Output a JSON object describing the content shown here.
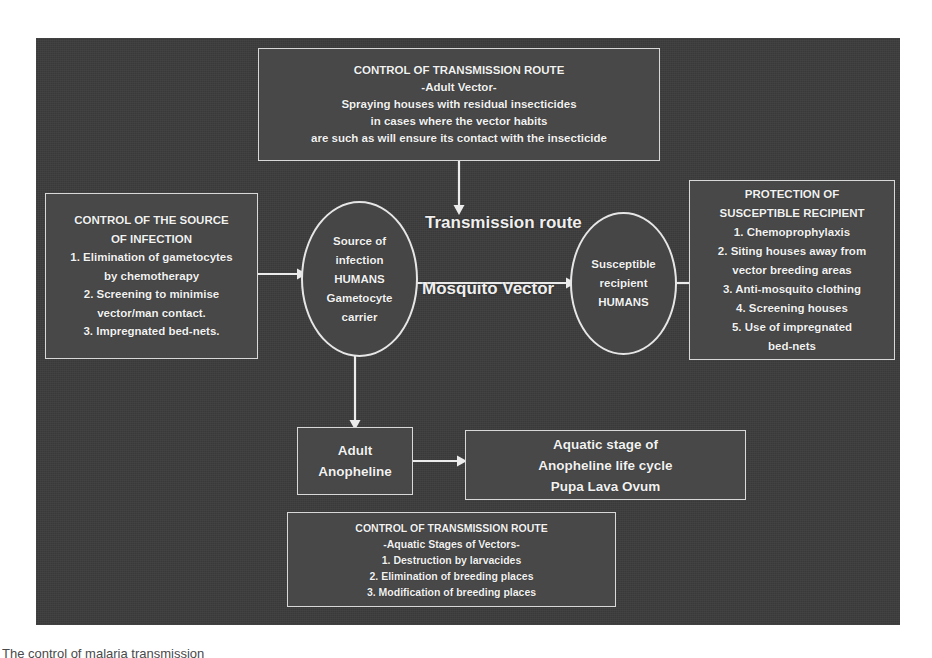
{
  "diagram": {
    "panel_color": "#3c3c3c",
    "box_color": "#484848",
    "stroke_color": "#e6e6e6",
    "text_color": "#f2f2f2",
    "boxes": {
      "top": {
        "name": "control-of-transmission-route-adult-vector",
        "lines": [
          "CONTROL OF TRANSMISSION ROUTE",
          "-Adult Vector-",
          "Spraying houses with residual insecticides",
          "in cases where the vector habits",
          "are such as will ensure its contact with the insecticide"
        ]
      },
      "left": {
        "name": "control-of-the-source-of-infection",
        "lines": [
          "CONTROL OF THE SOURCE",
          "OF INFECTION",
          "1. Elimination of gametocytes",
          "by chemotherapy",
          "2. Screening to minimise",
          "vector/man contact.",
          "3. Impregnated bed-nets."
        ]
      },
      "right": {
        "name": "protection-of-susceptible-recipient",
        "lines": [
          "PROTECTION OF",
          "SUSCEPTIBLE RECIPIENT",
          "1. Chemoprophylaxis",
          "2. Siting houses away from",
          "vector breeding areas",
          "3. Anti-mosquito clothing",
          "4. Screening houses",
          "5. Use of impregnated",
          "bed-nets"
        ]
      },
      "adult_anopheline": {
        "name": "adult-anopheline",
        "lines": [
          "Adult",
          "Anopheline"
        ]
      },
      "aquatic_stage": {
        "name": "aquatic-stage-of-anopheline-life-cycle",
        "lines": [
          "Aquatic stage of",
          "Anopheline life cycle",
          "Pupa    Lava    Ovum"
        ]
      },
      "bottom": {
        "name": "control-of-transmission-route-aquatic-stages",
        "lines": [
          "CONTROL OF TRANSMISSION ROUTE",
          "-Aquatic Stages of Vectors-",
          "1. Destruction by larvacides",
          "2. Elimination of breeding places",
          "3. Modification of breeding places"
        ]
      }
    },
    "ellipses": {
      "source": {
        "name": "source-of-infection-humans",
        "lines": [
          "Source of",
          "infection",
          "HUMANS",
          "Gametocyte",
          "carrier"
        ]
      },
      "recipient": {
        "name": "susceptible-recipient-humans",
        "lines": [
          "Susceptible",
          "recipient",
          "HUMANS"
        ]
      }
    },
    "labels": {
      "transmission_route": "Transmission route",
      "mosquito_vector": "Mosquito Vector"
    },
    "arrows": [
      {
        "name": "arrow-left-box-to-source",
        "from": "control-of-the-source-of-infection",
        "to": "source-of-infection-humans",
        "direction": "right"
      },
      {
        "name": "arrow-top-box-to-transmission",
        "from": "control-of-transmission-route-adult-vector",
        "to": "transmission-route-label",
        "direction": "down"
      },
      {
        "name": "arrow-source-to-recipient",
        "from": "source-of-infection-humans",
        "to": "susceptible-recipient-humans",
        "direction": "right"
      },
      {
        "name": "arrow-right-box-to-recipient",
        "from": "protection-of-susceptible-recipient",
        "to": "susceptible-recipient-humans",
        "direction": "left"
      },
      {
        "name": "arrow-source-to-adult-anopheline",
        "from": "source-of-infection-humans",
        "to": "adult-anopheline",
        "direction": "down"
      },
      {
        "name": "arrow-adult-to-aquatic-stage",
        "from": "adult-anopheline",
        "to": "aquatic-stage-of-anopheline-life-cycle",
        "direction": "right"
      }
    ]
  },
  "caption": "The control of malaria transmission"
}
